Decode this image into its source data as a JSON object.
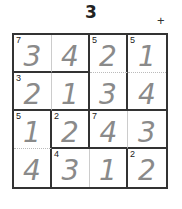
{
  "puzzle": {
    "title": "3",
    "operation_symbol": "+",
    "size": 4,
    "cages": [
      {
        "target": "7",
        "cells": [
          [
            0,
            0
          ],
          [
            0,
            1
          ]
        ]
      },
      {
        "target": "5",
        "cells": [
          [
            0,
            2
          ],
          [
            1,
            2
          ]
        ]
      },
      {
        "target": "5",
        "cells": [
          [
            0,
            3
          ],
          [
            1,
            3
          ]
        ]
      },
      {
        "target": "3",
        "cells": [
          [
            1,
            0
          ],
          [
            1,
            1
          ]
        ]
      },
      {
        "target": "5",
        "cells": [
          [
            2,
            0
          ],
          [
            3,
            0
          ]
        ]
      },
      {
        "target": "2",
        "cells": [
          [
            2,
            1
          ]
        ]
      },
      {
        "target": "7",
        "cells": [
          [
            2,
            2
          ],
          [
            2,
            3
          ]
        ]
      },
      {
        "target": "4",
        "cells": [
          [
            3,
            1
          ],
          [
            3,
            2
          ]
        ]
      },
      {
        "target": "2",
        "cells": [
          [
            3,
            3
          ]
        ]
      }
    ],
    "grid_values": [
      [
        "3",
        "4",
        "2",
        "1"
      ],
      [
        "2",
        "1",
        "3",
        "4"
      ],
      [
        "1",
        "2",
        "4",
        "3"
      ],
      [
        "4",
        "3",
        "1",
        "2"
      ]
    ],
    "clues": [
      [
        "7",
        "",
        "5",
        "5"
      ],
      [
        "3",
        "",
        "",
        ""
      ],
      [
        "5",
        "2",
        "7",
        ""
      ],
      [
        "",
        "4",
        "",
        "2"
      ]
    ]
  }
}
